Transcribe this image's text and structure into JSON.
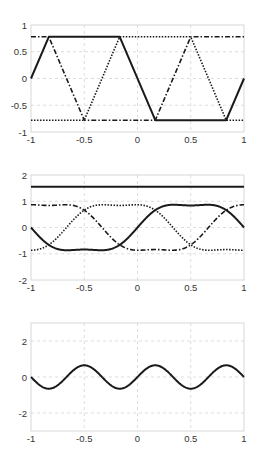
{
  "chart_data": [
    {
      "type": "line",
      "title": "",
      "xlabel": "",
      "ylabel": "",
      "xlim": [
        -1,
        1
      ],
      "ylim": [
        -1,
        1
      ],
      "xticks": [
        -1,
        -0.5,
        0,
        0.5,
        1
      ],
      "xtick_labels": [
        "-1",
        "-0.5",
        "0",
        "0.5",
        "1"
      ],
      "yticks": [
        -1,
        -0.5,
        0,
        0.5,
        1
      ],
      "ytick_labels": [
        "-1",
        "-0.5",
        "0",
        "0.5",
        "1"
      ],
      "grid": true,
      "legend": null,
      "box": {
        "left": 31,
        "top": 25,
        "right": 244,
        "bottom": 132
      },
      "series": [
        {
          "name": "phase-a",
          "style": "solid",
          "x": [
            -1,
            -0.833,
            -0.167,
            0.167,
            0.833,
            1
          ],
          "y": [
            0,
            0.78,
            0.78,
            -0.78,
            -0.78,
            0
          ]
        },
        {
          "name": "phase-b",
          "style": "dashdot",
          "x": [
            -1,
            -0.833,
            -0.5,
            0.167,
            0.5,
            1
          ],
          "y": [
            0.78,
            0.78,
            -0.78,
            -0.78,
            0.78,
            0.78
          ]
        },
        {
          "name": "phase-c",
          "style": "dotted",
          "x": [
            -1,
            -0.5,
            -0.167,
            0.5,
            0.833,
            1
          ],
          "y": [
            -0.78,
            -0.78,
            0.78,
            0.78,
            -0.78,
            -0.78
          ]
        }
      ]
    },
    {
      "type": "line",
      "title": "",
      "xlabel": "",
      "ylabel": "",
      "xlim": [
        -1,
        1
      ],
      "ylim": [
        -2,
        2
      ],
      "xticks": [
        -1,
        -0.5,
        0,
        0.5,
        1
      ],
      "xtick_labels": [
        "-1",
        "-0.5",
        "0",
        "0.5",
        "1"
      ],
      "yticks": [
        -2,
        -1,
        0,
        1,
        2
      ],
      "ytick_labels": [
        "-2",
        "-1",
        "0",
        "1",
        "2"
      ],
      "grid": true,
      "legend": null,
      "box": {
        "left": 31,
        "top": 175,
        "right": 244,
        "bottom": 280
      },
      "series": [
        {
          "name": "constant",
          "style": "solid",
          "x": [
            -1,
            1
          ],
          "y": [
            1.55,
            1.55
          ]
        },
        {
          "name": "phase-a",
          "style": "solid",
          "function": "clipped-sine",
          "phase": 0
        },
        {
          "name": "phase-b",
          "style": "dashdot",
          "function": "clipped-sine",
          "phase": 0.6667
        },
        {
          "name": "phase-c",
          "style": "dotted",
          "function": "clipped-sine",
          "phase": -0.6667
        }
      ]
    },
    {
      "type": "line",
      "title": "",
      "xlabel": "",
      "ylabel": "",
      "xlim": [
        -1,
        1
      ],
      "ylim": [
        -3,
        3
      ],
      "xticks": [
        -1,
        -0.5,
        0,
        0.5,
        1
      ],
      "xtick_labels": [
        "-1",
        "-0.5",
        "0",
        "0.5",
        "1"
      ],
      "yticks": [
        -2,
        0,
        2
      ],
      "ytick_labels": [
        "-2",
        "0",
        "2"
      ],
      "grid": true,
      "legend": null,
      "box": {
        "left": 31,
        "top": 323,
        "right": 244,
        "bottom": 431
      },
      "series": [
        {
          "name": "sum",
          "style": "solid",
          "function": "sine3",
          "amplitude": -0.65
        }
      ]
    }
  ]
}
